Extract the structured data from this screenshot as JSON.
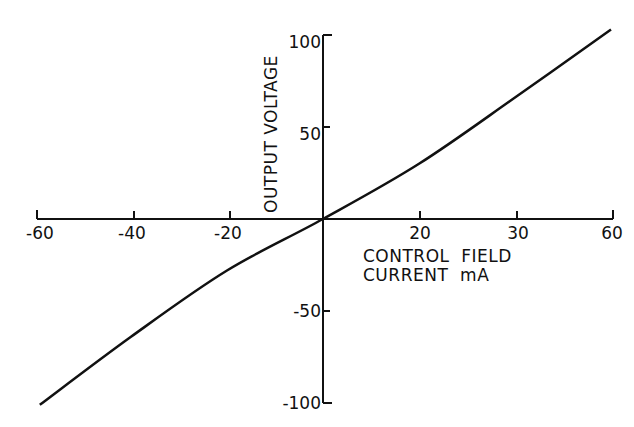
{
  "chart_data": {
    "type": "line",
    "title": "",
    "xlabel": "CONTROL FIELD CURRENT mA",
    "xlabel_lines": [
      "CONTROL  FIELD",
      "CURRENT  mA"
    ],
    "ylabel": "OUTPUT VOLTAGE",
    "x_ticks": [
      "-60",
      "-40",
      "-20",
      "20",
      "30",
      "60"
    ],
    "y_ticks": [
      "100",
      "50",
      "-50",
      "-100"
    ],
    "xlim": [
      -60,
      60
    ],
    "ylim": [
      -100,
      100
    ],
    "grid": false,
    "legend": null,
    "series": [
      {
        "name": "output voltage",
        "x": [
          -59,
          -40,
          -20,
          0,
          20,
          40,
          60
        ],
        "values": [
          -101,
          -64,
          -28,
          0,
          30,
          66,
          103
        ]
      }
    ]
  },
  "colors": {
    "line": "#111111",
    "background": "#ffffff"
  }
}
